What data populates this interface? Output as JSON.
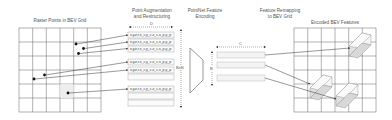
{
  "titles": {
    "raster": "Raster Points in BEV Grid",
    "augment_line1": "Point Augmentation",
    "augment_line2": "and Restructuring",
    "pointnet_line1": "PointNet Feature",
    "pointnet_line2": "Encoding",
    "remap_line1": "Feature Remapping",
    "remap_line2": "to BEV Grid",
    "encoded": "Encoded BEV Features"
  },
  "dimensions": {
    "d_label": "D",
    "bn_label": "BxN",
    "c_label": "C",
    "b_label": "B"
  },
  "point_rows": [
    "x,y,z,r,x_c,y_c,z_c,x_p,y_p",
    "x,y,z,r,x_c,y_c,z_c,x_p,y_p",
    "x,y,z,r,x_c,y_c,z_c,x_p,y_p",
    "x,y,z,r,x_c,y_c,z_c,x_p,y_p",
    "x,y,z,r,x_c,y_c,z_c,x_p,y_p",
    "x,y,z,r,x_c,y_c,z_c,x_p,y_p"
  ],
  "colors": {
    "grid": "#555555",
    "arrow": "#333333",
    "point": "#111111",
    "feature_bar": "#f2f2f2",
    "cube_face": "#e6e6e6"
  }
}
